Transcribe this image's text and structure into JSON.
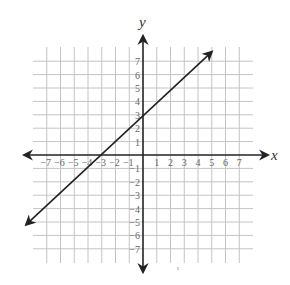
{
  "chart_data": {
    "type": "line",
    "title": "",
    "xlabel": "x",
    "ylabel": "y",
    "xlim": [
      -8,
      8
    ],
    "ylim": [
      -8,
      8
    ],
    "grid": true,
    "x_ticks": [
      -7,
      -6,
      -5,
      -4,
      -3,
      -2,
      -1,
      1,
      2,
      3,
      4,
      5,
      6,
      7
    ],
    "y_ticks": [
      7,
      6,
      5,
      4,
      3,
      2,
      1,
      -1,
      -2,
      -3,
      -4,
      -5,
      -6,
      -7
    ],
    "x_tick_labels": [
      "−7",
      "−6",
      "−5",
      "−4",
      "−3",
      "−2",
      "−1",
      "1",
      "2",
      "3",
      "4",
      "5",
      "6",
      "7"
    ],
    "y_tick_labels": [
      "7",
      "6",
      "5",
      "4",
      "3",
      "2",
      "1",
      "−1",
      "−2",
      "−3",
      "−4",
      "−5",
      "−6",
      "−7"
    ],
    "series": [
      {
        "name": "y = x + 3",
        "equation": "y = x + 3",
        "slope": 1,
        "y_intercept": 3,
        "x_intercept": -3,
        "points": [
          [
            -8.5,
            -5.2
          ],
          [
            -3,
            0
          ],
          [
            0,
            3
          ],
          [
            1,
            4
          ],
          [
            5,
            7.7
          ]
        ],
        "arrows_both_ends": true
      }
    ],
    "legend": null
  }
}
